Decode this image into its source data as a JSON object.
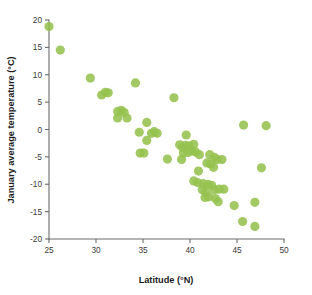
{
  "chart_data": {
    "type": "scatter",
    "title": "",
    "xlabel": "Latitude (°N)",
    "ylabel": "January average temperature (°C)",
    "xlim": [
      25,
      50
    ],
    "ylim": [
      -20,
      20
    ],
    "xticks": [
      25,
      30,
      35,
      40,
      45,
      50
    ],
    "yticks": [
      20,
      15,
      10,
      5,
      0,
      -5,
      -10,
      -15,
      -20
    ],
    "grid": false,
    "legend": null,
    "marker_color": "#95c14e",
    "marker_size": 4.6,
    "series": [
      {
        "name": "cities",
        "points": [
          [
            25.0,
            18.8
          ],
          [
            26.2,
            14.5
          ],
          [
            29.4,
            9.4
          ],
          [
            30.6,
            6.3
          ],
          [
            31.0,
            6.8
          ],
          [
            31.3,
            6.7
          ],
          [
            32.3,
            3.3
          ],
          [
            32.7,
            3.5
          ],
          [
            33.0,
            3.1
          ],
          [
            32.3,
            2.1
          ],
          [
            33.3,
            2.1
          ],
          [
            34.2,
            8.5
          ],
          [
            35.4,
            1.3
          ],
          [
            34.6,
            -0.5
          ],
          [
            35.9,
            -0.7
          ],
          [
            36.2,
            -0.4
          ],
          [
            36.5,
            -0.7
          ],
          [
            35.4,
            -2.0
          ],
          [
            34.7,
            -4.3
          ],
          [
            35.1,
            -4.3
          ],
          [
            38.3,
            5.8
          ],
          [
            37.6,
            -5.4
          ],
          [
            39.1,
            -5.5
          ],
          [
            39.6,
            -1.0
          ],
          [
            38.9,
            -2.8
          ],
          [
            39.2,
            -3.3
          ],
          [
            39.5,
            -2.9
          ],
          [
            39.9,
            -3.0
          ],
          [
            40.4,
            -2.7
          ],
          [
            39.3,
            -4.3
          ],
          [
            39.8,
            -4.2
          ],
          [
            40.2,
            -3.9
          ],
          [
            40.6,
            -4.1
          ],
          [
            41.0,
            -4.6
          ],
          [
            42.1,
            -4.6
          ],
          [
            42.6,
            -5.1
          ],
          [
            42.9,
            -5.5
          ],
          [
            43.4,
            -5.5
          ],
          [
            41.8,
            -6.1
          ],
          [
            42.2,
            -6.3
          ],
          [
            42.5,
            -6.9
          ],
          [
            40.9,
            -7.6
          ],
          [
            40.4,
            -9.4
          ],
          [
            40.8,
            -9.7
          ],
          [
            41.4,
            -9.9
          ],
          [
            41.9,
            -10.0
          ],
          [
            42.3,
            -10.2
          ],
          [
            41.3,
            -11.0
          ],
          [
            41.7,
            -11.4
          ],
          [
            42.6,
            -11.0
          ],
          [
            43.1,
            -10.9
          ],
          [
            43.6,
            -10.9
          ],
          [
            41.6,
            -12.4
          ],
          [
            42.0,
            -12.3
          ],
          [
            42.7,
            -12.6
          ],
          [
            43.0,
            -13.2
          ],
          [
            44.7,
            -13.9
          ],
          [
            45.7,
            0.8
          ],
          [
            48.1,
            0.7
          ],
          [
            47.6,
            -7.0
          ],
          [
            46.9,
            -13.3
          ],
          [
            45.6,
            -16.8
          ],
          [
            46.9,
            -17.7
          ]
        ]
      }
    ]
  },
  "axes": {
    "x_tick_labels": [
      "25",
      "30",
      "35",
      "40",
      "45",
      "50"
    ],
    "y_tick_labels": [
      "20",
      "15",
      "10",
      "5",
      "0",
      "-5",
      "-10",
      "-15",
      "-20"
    ]
  }
}
